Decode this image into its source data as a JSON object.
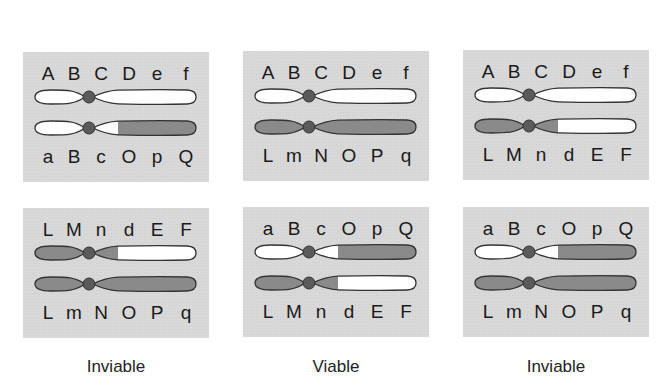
{
  "colors": {
    "panel_bg": "#d8d8d8",
    "white_segment": "#ffffff",
    "gray_segment": "#8a8a8a",
    "outline": "#333333",
    "centromere": "#5a5a5a"
  },
  "panels": [
    {
      "top_labels": [
        "A",
        "B",
        "C",
        "D",
        "e",
        "f"
      ],
      "chromosomes": [
        {
          "left": "white",
          "right_short": "white",
          "right_long": "white"
        },
        {
          "left": "white",
          "right_short": "white",
          "right_long": "gray"
        }
      ],
      "bottom_labels": [
        "a",
        "B",
        "c",
        "O",
        "p",
        "Q"
      ]
    },
    {
      "top_labels": [
        "A",
        "B",
        "C",
        "D",
        "e",
        "f"
      ],
      "chromosomes": [
        {
          "left": "white",
          "right_short": "white",
          "right_long": "white"
        },
        {
          "left": "gray",
          "right_short": "gray",
          "right_long": "gray"
        }
      ],
      "bottom_labels": [
        "L",
        "m",
        "N",
        "O",
        "P",
        "q"
      ]
    },
    {
      "top_labels": [
        "A",
        "B",
        "C",
        "D",
        "e",
        "f"
      ],
      "chromosomes": [
        {
          "left": "white",
          "right_short": "white",
          "right_long": "white"
        },
        {
          "left": "gray",
          "right_short": "gray",
          "right_long": "white"
        }
      ],
      "bottom_labels": [
        "L",
        "M",
        "n",
        "d",
        "E",
        "F"
      ]
    },
    {
      "top_labels": [
        "L",
        "M",
        "n",
        "d",
        "E",
        "F"
      ],
      "chromosomes": [
        {
          "left": "gray",
          "right_short": "gray",
          "right_long": "white"
        },
        {
          "left": "gray",
          "right_short": "gray",
          "right_long": "gray"
        }
      ],
      "bottom_labels": [
        "L",
        "m",
        "N",
        "O",
        "P",
        "q"
      ],
      "caption": "Inviable"
    },
    {
      "top_labels": [
        "a",
        "B",
        "c",
        "O",
        "p",
        "Q"
      ],
      "chromosomes": [
        {
          "left": "white",
          "right_short": "white",
          "right_long": "gray"
        },
        {
          "left": "gray",
          "right_short": "gray",
          "right_long": "white"
        }
      ],
      "bottom_labels": [
        "L",
        "M",
        "n",
        "d",
        "E",
        "F"
      ],
      "caption": "Viable"
    },
    {
      "top_labels": [
        "a",
        "B",
        "c",
        "O",
        "p",
        "Q"
      ],
      "chromosomes": [
        {
          "left": "white",
          "right_short": "white",
          "right_long": "gray"
        },
        {
          "left": "gray",
          "right_short": "gray",
          "right_long": "gray"
        }
      ],
      "bottom_labels": [
        "L",
        "m",
        "N",
        "O",
        "P",
        "q"
      ],
      "caption": "Inviable"
    }
  ],
  "captions": [
    "Inviable",
    "Viable",
    "Inviable"
  ]
}
